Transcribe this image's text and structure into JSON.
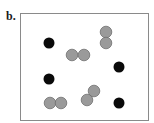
{
  "panel": {
    "label": "b."
  },
  "frame": {
    "x": 20.5,
    "y": 13.5,
    "width": 128,
    "height": 107,
    "stroke": "#8a8a8a"
  },
  "colors": {
    "black_particle": "#0a0a0a",
    "gray_particle_fill": "#9a9a9a",
    "gray_particle_stroke": "#6e6e6e"
  },
  "particles": {
    "black": [
      {
        "cx": 49,
        "cy": 43,
        "r": 5.5
      },
      {
        "cx": 119,
        "cy": 67,
        "r": 5.5
      },
      {
        "cx": 49,
        "cy": 79,
        "r": 5.5
      },
      {
        "cx": 119,
        "cy": 103,
        "r": 5.5
      }
    ],
    "gray_pairs": [
      {
        "a": {
          "cx": 72,
          "cy": 55
        },
        "b": {
          "cx": 84,
          "cy": 55
        },
        "r": 5.8
      },
      {
        "a": {
          "cx": 106,
          "cy": 32
        },
        "b": {
          "cx": 106,
          "cy": 43
        },
        "r": 5.8
      },
      {
        "a": {
          "cx": 50,
          "cy": 103
        },
        "b": {
          "cx": 61,
          "cy": 103
        },
        "r": 5.8
      },
      {
        "a": {
          "cx": 94,
          "cy": 91
        },
        "b": {
          "cx": 87,
          "cy": 100
        },
        "r": 5.8
      }
    ]
  }
}
